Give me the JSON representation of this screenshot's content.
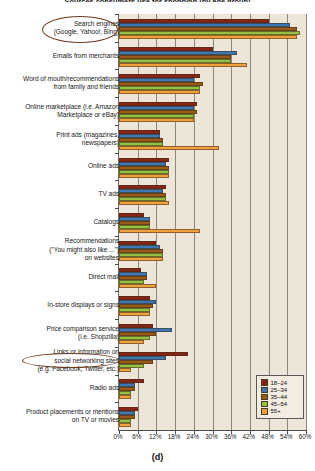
{
  "title": "Sources consumers use for shopping (by age group)",
  "caption": "(d)",
  "axis": {
    "xlabel": "",
    "ylabel": "",
    "xticks": [
      "0%",
      "6%",
      "12%",
      "18%",
      "24%",
      "30%",
      "36%",
      "42%",
      "48%",
      "54%",
      "60%"
    ],
    "xmin": 0,
    "xmax": 60,
    "grid": true
  },
  "legend": {
    "position": "bottom-right",
    "entries": [
      {
        "label": "18–24",
        "color": "#8a2316"
      },
      {
        "label": "25–34",
        "color": "#3d78b4"
      },
      {
        "label": "35–44",
        "color": "#9a5a18"
      },
      {
        "label": "45–54",
        "color": "#93c13f"
      },
      {
        "label": "55+",
        "color": "#f0a03c"
      }
    ]
  },
  "highlights": [
    {
      "name": "search-engines-highlight",
      "label": "Search engines (Google, Yahoo!, Bing)"
    },
    {
      "name": "social-networking-highlight",
      "label": "Social networking sites"
    }
  ],
  "chart_data": {
    "type": "bar",
    "orientation": "horizontal",
    "title": "Sources consumers use for shopping (by age group)",
    "xlabel": "",
    "ylabel": "",
    "xlim": [
      0,
      60
    ],
    "grid": true,
    "legend_position": "bottom-right",
    "categories": [
      "Search engines\n(Google, Yahoo!, Bing)",
      "Emails from merchants",
      "Word of mouth/recommendations\nfrom family and friends",
      "Online marketplace (i.e. Amazon\nMarketplace or eBay)",
      "Print ads (magazines,\nnewspapers)",
      "Online ads",
      "TV ads",
      "Catalogs",
      "Recommendations\n(\"You might also like ...\")\non websites",
      "Direct mail",
      "In-store displays or signs",
      "Price comparison service\n(i.e. Shopzilla)",
      "Links or information on\nsocial networking sites\n(e.g. Facebook, Twitter, etc.)",
      "Radio ads",
      "Product placements or mentions\non TV or movies"
    ],
    "series": [
      {
        "name": "18–24",
        "color": "#8a2316",
        "values": [
          48,
          30,
          26,
          25,
          13,
          16,
          15,
          8,
          12,
          7,
          10,
          11,
          22,
          8,
          6
        ]
      },
      {
        "name": "25–34",
        "color": "#3d78b4",
        "values": [
          55,
          38,
          24,
          24,
          13,
          15,
          14,
          10,
          13,
          9,
          12,
          17,
          15,
          5,
          5
        ]
      },
      {
        "name": "35–44",
        "color": "#9a5a18",
        "values": [
          57,
          36,
          27,
          25,
          14,
          16,
          15,
          10,
          14,
          9,
          11,
          12,
          11,
          5,
          5
        ]
      },
      {
        "name": "45–54",
        "color": "#93c13f",
        "values": [
          58,
          36,
          26,
          24,
          14,
          16,
          15,
          10,
          14,
          8,
          10,
          10,
          8,
          4,
          4
        ]
      },
      {
        "name": "55+",
        "color": "#f0a03c",
        "values": [
          57,
          41,
          26,
          24,
          32,
          16,
          16,
          26,
          14,
          12,
          10,
          8,
          4,
          4,
          4
        ]
      }
    ]
  }
}
